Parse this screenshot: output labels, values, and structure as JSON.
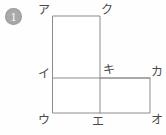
{
  "problem": {
    "number_label": "1",
    "bullet_icon": "circled-number-one"
  },
  "figure": {
    "type": "composite-rectangle-geometry",
    "background_color": "#fefefe",
    "fill_color": "#ffffff",
    "stroke_color": "#8c8c8c",
    "label_color": "#4a4a4a",
    "vertices": [
      {
        "id": "a",
        "label": "ア",
        "x": 53,
        "y": 16,
        "label_x": 38,
        "label_y": 4
      },
      {
        "id": "ku",
        "label": "ク",
        "x": 100,
        "y": 16,
        "label_x": 101,
        "label_y": 4
      },
      {
        "id": "i",
        "label": "イ",
        "x": 53,
        "y": 78,
        "label_x": 38,
        "label_y": 68
      },
      {
        "id": "ki",
        "label": "キ",
        "x": 100,
        "y": 78,
        "label_x": 103,
        "label_y": 64
      },
      {
        "id": "ka",
        "label": "カ",
        "x": 150,
        "y": 78,
        "label_x": 151,
        "label_y": 66
      },
      {
        "id": "u",
        "label": "ウ",
        "x": 53,
        "y": 113,
        "label_x": 38,
        "label_y": 114
      },
      {
        "id": "e",
        "label": "エ",
        "x": 100,
        "y": 113,
        "label_x": 92,
        "label_y": 116
      },
      {
        "id": "o",
        "label": "オ",
        "x": 150,
        "y": 113,
        "label_x": 151,
        "label_y": 114
      }
    ],
    "outline_path": "M 53 16 L 100 16 L 100 78 L 150 78 L 150 113 L 53 113 Z",
    "inner_segments": [
      {
        "id": "segment-i-ki-ka",
        "x1": 53,
        "y1": 78,
        "x2": 150,
        "y2": 78
      },
      {
        "id": "segment-ki-e",
        "x1": 100,
        "y1": 78,
        "x2": 100,
        "y2": 113
      }
    ],
    "regions": [
      {
        "id": "tall-rectangle",
        "corners": "アクキイ"
      },
      {
        "id": "lower-left-square",
        "corners": "イキエウ"
      },
      {
        "id": "lower-right-rectangle",
        "corners": "キカオエ"
      }
    ]
  }
}
